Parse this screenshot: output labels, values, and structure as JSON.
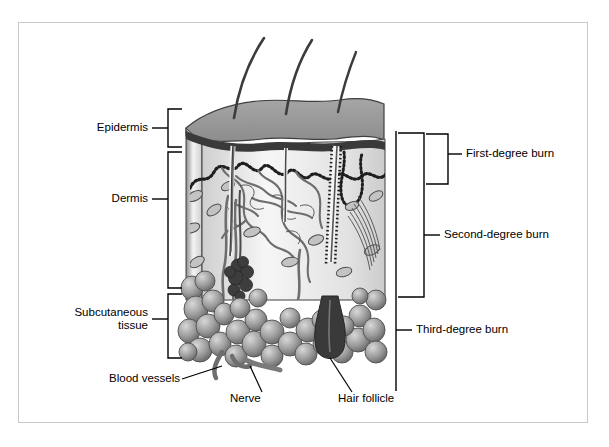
{
  "diagram": {
    "background_color": "#ffffff",
    "frame_color": "#c9c9c9",
    "line_color": "#000000"
  },
  "layer_labels": [
    {
      "id": "epidermis",
      "text": "Epidermis"
    },
    {
      "id": "dermis",
      "text": "Dermis"
    },
    {
      "id": "subcutaneous",
      "text": "Subcutaneous\ntissue"
    }
  ],
  "burn_labels": [
    {
      "id": "first-degree",
      "text": "First-degree burn"
    },
    {
      "id": "second-degree",
      "text": "Second-degree burn"
    },
    {
      "id": "third-degree",
      "text": "Third-degree burn"
    }
  ],
  "structure_labels": [
    {
      "id": "blood-vessels",
      "text": "Blood vessels"
    },
    {
      "id": "nerve",
      "text": "Nerve"
    },
    {
      "id": "hair-follicle",
      "text": "Hair follicle"
    }
  ],
  "tissue": {
    "epidermis_surface_color": "#9a9a9a",
    "epidermis_band_color": "#3a3a3a",
    "dermis_fill_color": "#e8e8e8",
    "vessel_color": "#6e6e6e",
    "fat_globule_color": "#8e8e8e",
    "hair_color": "#3c3c3c",
    "gland_color": "#404040"
  }
}
